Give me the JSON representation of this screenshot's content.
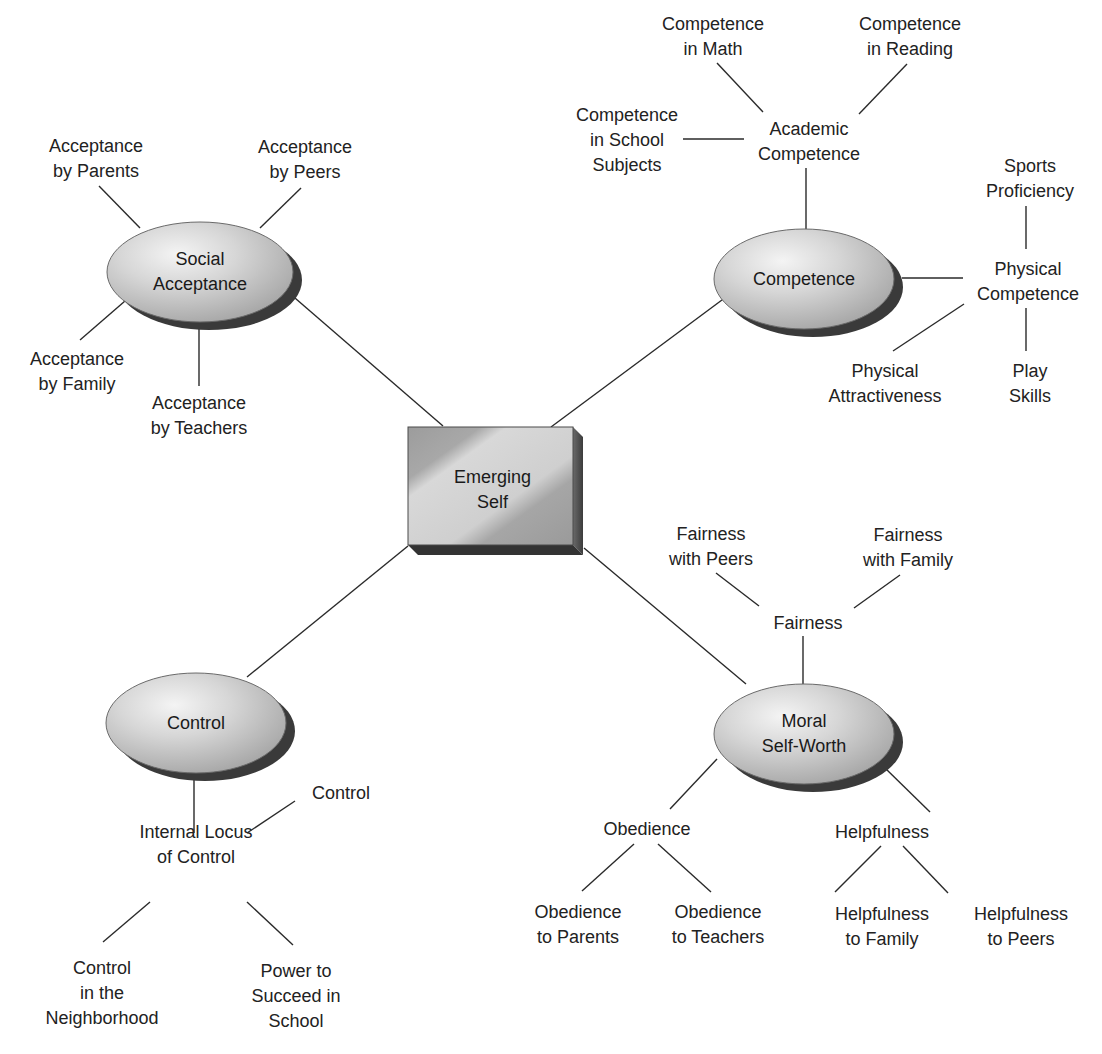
{
  "diagram": {
    "title": "Emerging Self",
    "colors": {
      "line": "#2a2a2a",
      "ellipse_light": "#ececec",
      "ellipse_mid": "#c4c4c4",
      "ellipse_shadow": "#3a3a3a",
      "box_light": "#d6d6d6",
      "box_mid": "#a8a8a8",
      "box_side": "#555555",
      "box_bottom": "#333333",
      "text": "#222222"
    },
    "center": {
      "lines": [
        "Emerging",
        "Self"
      ],
      "x": 408,
      "y": 427,
      "w": 165,
      "h": 118,
      "depth": 10
    },
    "ellipses": [
      {
        "id": "social-acceptance",
        "lines": [
          "Social",
          "Acceptance"
        ],
        "cx": 200,
        "cy": 272,
        "rx": 93,
        "ry": 50
      },
      {
        "id": "competence",
        "lines": [
          "Competence"
        ],
        "cx": 804,
        "cy": 279,
        "rx": 90,
        "ry": 50
      },
      {
        "id": "control",
        "lines": [
          "Control"
        ],
        "cx": 196,
        "cy": 723,
        "rx": 90,
        "ry": 50
      },
      {
        "id": "moral-self-worth",
        "lines": [
          "Moral",
          "Self-Worth"
        ],
        "cx": 804,
        "cy": 734,
        "rx": 90,
        "ry": 50
      }
    ],
    "labels": [
      {
        "id": "acceptance-by-parents",
        "lines": [
          "Acceptance",
          "by Parents"
        ],
        "x": 96,
        "y": 159
      },
      {
        "id": "acceptance-by-peers",
        "lines": [
          "Acceptance",
          "by Peers"
        ],
        "x": 305,
        "y": 160
      },
      {
        "id": "acceptance-by-family",
        "lines": [
          "Acceptance",
          "by Family"
        ],
        "x": 77,
        "y": 372
      },
      {
        "id": "acceptance-by-teachers",
        "lines": [
          "Acceptance",
          "by Teachers"
        ],
        "x": 199,
        "y": 416
      },
      {
        "id": "competence-in-math",
        "lines": [
          "Competence",
          "in Math"
        ],
        "x": 713,
        "y": 37
      },
      {
        "id": "competence-in-reading",
        "lines": [
          "Competence",
          "in Reading"
        ],
        "x": 910,
        "y": 37
      },
      {
        "id": "competence-in-school-subjects",
        "lines": [
          "Competence",
          "in School",
          "Subjects"
        ],
        "x": 627,
        "y": 140
      },
      {
        "id": "academic-competence",
        "lines": [
          "Academic",
          "Competence"
        ],
        "x": 809,
        "y": 142
      },
      {
        "id": "sports-proficiency",
        "lines": [
          "Sports",
          "Proficiency"
        ],
        "x": 1030,
        "y": 179
      },
      {
        "id": "physical-competence",
        "lines": [
          "Physical",
          "Competence"
        ],
        "x": 1028,
        "y": 282
      },
      {
        "id": "physical-attractiveness",
        "lines": [
          "Physical",
          "Attractiveness"
        ],
        "x": 885,
        "y": 384
      },
      {
        "id": "play-skills",
        "lines": [
          "Play",
          "Skills"
        ],
        "x": 1030,
        "y": 384
      },
      {
        "id": "fairness-with-peers",
        "lines": [
          "Fairness",
          "with Peers"
        ],
        "x": 711,
        "y": 547
      },
      {
        "id": "fairness-with-family",
        "lines": [
          "Fairness",
          "with Family"
        ],
        "x": 908,
        "y": 548
      },
      {
        "id": "fairness",
        "lines": [
          "Fairness"
        ],
        "x": 808,
        "y": 623
      },
      {
        "id": "control-leaf",
        "lines": [
          "Control"
        ],
        "x": 341,
        "y": 793
      },
      {
        "id": "internal-locus-of-control",
        "lines": [
          "Internal Locus",
          "of Control"
        ],
        "x": 196,
        "y": 845
      },
      {
        "id": "control-in-the-neighborhood",
        "lines": [
          "Control",
          "in the",
          "Neighborhood"
        ],
        "x": 102,
        "y": 993
      },
      {
        "id": "power-to-succeed-in-school",
        "lines": [
          "Power to",
          "Succeed in",
          "School"
        ],
        "x": 296,
        "y": 996
      },
      {
        "id": "obedience",
        "lines": [
          "Obedience"
        ],
        "x": 647,
        "y": 829
      },
      {
        "id": "helpfulness",
        "lines": [
          "Helpfulness"
        ],
        "x": 882,
        "y": 832
      },
      {
        "id": "obedience-to-parents",
        "lines": [
          "Obedience",
          "to Parents"
        ],
        "x": 578,
        "y": 925
      },
      {
        "id": "obedience-to-teachers",
        "lines": [
          "Obedience",
          "to Teachers"
        ],
        "x": 718,
        "y": 925
      },
      {
        "id": "helpfulness-to-family",
        "lines": [
          "Helpfulness",
          "to Family"
        ],
        "x": 882,
        "y": 927
      },
      {
        "id": "helpfulness-to-peers",
        "lines": [
          "Helpfulness",
          "to Peers"
        ],
        "x": 1021,
        "y": 927
      }
    ],
    "connectors": [
      {
        "id": "self-to-social",
        "x1": 443,
        "y1": 426,
        "x2": 288,
        "y2": 292
      },
      {
        "id": "self-to-competence",
        "x1": 551,
        "y1": 427,
        "x2": 726,
        "y2": 297
      },
      {
        "id": "self-to-control",
        "x1": 408,
        "y1": 546,
        "x2": 247,
        "y2": 677
      },
      {
        "id": "self-to-moral",
        "x1": 584,
        "y1": 548,
        "x2": 746,
        "y2": 684
      },
      {
        "id": "social-to-parents",
        "x1": 140,
        "y1": 228,
        "x2": 99,
        "y2": 186
      },
      {
        "id": "social-to-peers",
        "x1": 260,
        "y1": 228,
        "x2": 301,
        "y2": 188
      },
      {
        "id": "social-to-family",
        "x1": 125,
        "y1": 301,
        "x2": 80,
        "y2": 340
      },
      {
        "id": "social-to-teachers",
        "x1": 199,
        "y1": 323,
        "x2": 199,
        "y2": 386
      },
      {
        "id": "competence-to-academic",
        "x1": 806,
        "y1": 229,
        "x2": 806,
        "y2": 168
      },
      {
        "id": "academic-to-math",
        "x1": 763,
        "y1": 112,
        "x2": 717,
        "y2": 63
      },
      {
        "id": "academic-to-reading",
        "x1": 859,
        "y1": 114,
        "x2": 907,
        "y2": 64
      },
      {
        "id": "academic-to-school",
        "x1": 744,
        "y1": 139,
        "x2": 683,
        "y2": 139
      },
      {
        "id": "competence-to-physical",
        "x1": 902,
        "y1": 278,
        "x2": 963,
        "y2": 278
      },
      {
        "id": "physical-to-sports",
        "x1": 1026,
        "y1": 249,
        "x2": 1026,
        "y2": 206
      },
      {
        "id": "physical-to-attractiveness",
        "x1": 964,
        "y1": 304,
        "x2": 893,
        "y2": 351
      },
      {
        "id": "physical-to-play",
        "x1": 1026,
        "y1": 308,
        "x2": 1026,
        "y2": 351
      },
      {
        "id": "moral-to-fairness",
        "x1": 803,
        "y1": 684,
        "x2": 803,
        "y2": 636
      },
      {
        "id": "fairness-to-peers",
        "x1": 759,
        "y1": 606,
        "x2": 716,
        "y2": 573
      },
      {
        "id": "fairness-to-family",
        "x1": 854,
        "y1": 608,
        "x2": 900,
        "y2": 575
      },
      {
        "id": "control-to-internal",
        "x1": 194,
        "y1": 773,
        "x2": 194,
        "y2": 833
      },
      {
        "id": "internal-to-control-leaf",
        "x1": 247,
        "y1": 833,
        "x2": 295,
        "y2": 801
      },
      {
        "id": "internal-to-neighborhood",
        "x1": 150,
        "y1": 902,
        "x2": 103,
        "y2": 942
      },
      {
        "id": "internal-to-power",
        "x1": 247,
        "y1": 902,
        "x2": 293,
        "y2": 945
      },
      {
        "id": "moral-to-obedience",
        "x1": 717,
        "y1": 759,
        "x2": 670,
        "y2": 809
      },
      {
        "id": "moral-to-helpfulness",
        "x1": 885,
        "y1": 768,
        "x2": 930,
        "y2": 812
      },
      {
        "id": "obedience-to-parents-line",
        "x1": 634,
        "y1": 844,
        "x2": 582,
        "y2": 891
      },
      {
        "id": "obedience-to-teachers-line",
        "x1": 658,
        "y1": 844,
        "x2": 711,
        "y2": 892
      },
      {
        "id": "helpfulness-to-family-line",
        "x1": 881,
        "y1": 846,
        "x2": 835,
        "y2": 892
      },
      {
        "id": "helpfulness-to-peers-line",
        "x1": 903,
        "y1": 846,
        "x2": 948,
        "y2": 893
      }
    ]
  }
}
